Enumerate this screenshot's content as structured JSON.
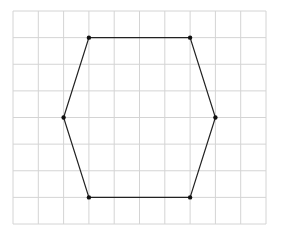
{
  "diagram": {
    "type": "polygon-on-grid",
    "shape": "hexagon",
    "grid": {
      "columns": 10,
      "rows": 8,
      "origin": [
        13,
        11
      ],
      "width": 253,
      "height": 213,
      "line_color": "#d4d4d4"
    },
    "polygon": {
      "stroke_color": "#222222",
      "vertex_color": "#111111",
      "vertices_grid": [
        [
          3,
          1
        ],
        [
          7,
          1
        ],
        [
          8,
          4
        ],
        [
          7,
          7
        ],
        [
          3,
          7
        ],
        [
          2,
          4
        ]
      ]
    }
  }
}
